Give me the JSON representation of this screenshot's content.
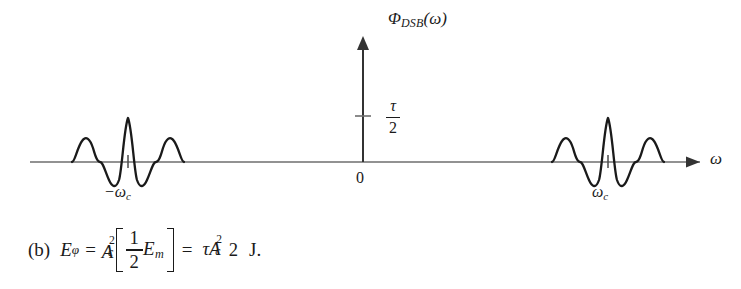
{
  "figure": {
    "y_axis": {
      "label_symbol": "Φ",
      "label_subscript": "DSB",
      "label_arg": "(ω)"
    },
    "x_axis": {
      "label": "ω"
    },
    "origin_label": "0",
    "amplitude_tick": {
      "numerator": "τ",
      "denominator": "2"
    },
    "pulses": [
      {
        "name": "negative-carrier-pulse",
        "label_prefix": "−ω",
        "label_subscript": "c"
      },
      {
        "name": "positive-carrier-pulse",
        "label_prefix": "ω",
        "label_subscript": "c"
      }
    ],
    "colors": {
      "curve": "#1a1a1a",
      "axis": "#6e6e6e",
      "vertical_axis": "#333333",
      "background": "#ffffff"
    }
  },
  "equation": {
    "tag": "(b)",
    "lhs_symbol": "E",
    "lhs_subscript": "φ",
    "equals": "=",
    "coef_base": "A",
    "coef_sub": "c",
    "coef_sup": "2",
    "bracket_open": "[",
    "bracket_frac_num": "1",
    "bracket_frac_den": "2",
    "bracket_symbol": "E",
    "bracket_subscript": "m",
    "bracket_close": "]",
    "equals2": "=",
    "result_num_tau": "τ",
    "result_num_base": "A",
    "result_num_sub": "c",
    "result_num_sup": "2",
    "result_den": "2",
    "unit": "J."
  }
}
